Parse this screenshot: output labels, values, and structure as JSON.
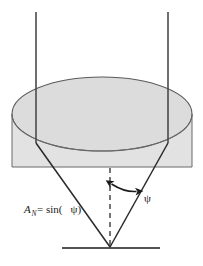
{
  "figure": {
    "background_color": "#ffffff",
    "labels": {
      "formula_a": "A",
      "formula_subscript": "N",
      "formula_equals": " = sin(",
      "formula_close": ")",
      "formula_psi": "ψ",
      "formula_full": "A_N = sin(ψ)",
      "angle_label": "ψ"
    },
    "colors": {
      "cylinder_fill": "#e2e2e2",
      "cylinder_stroke": "#6b6b6b",
      "ellipse_fill": "#dcdcdc",
      "ellipse_stroke": "#5a5a5a",
      "ray_stroke": "#2a2a2a",
      "vertical_ray_stroke": "#4a4a4a",
      "axis_dash_stroke": "#3a3a3a",
      "baseline_stroke": "#1a1a1a",
      "arrow_stroke": "#1a1a1a",
      "text_color": "#1a1a1a"
    },
    "geometry": {
      "rect_left": 12,
      "rect_top": 95,
      "rect_right": 192,
      "rect_bottom": 167,
      "ellipse_cx": 102,
      "ellipse_cy": 114,
      "ellipse_rx": 90,
      "ellipse_ry": 37,
      "vertical_ray_left_x": 36,
      "vertical_ray_right_x": 168,
      "vertical_ray_top_y": 12,
      "apex_x": 110,
      "apex_y": 247,
      "baseline_left_x": 62,
      "baseline_right_x": 160,
      "baseline_y": 248,
      "axis_dash_top_y": 168,
      "angle_degrees": 21
    }
  }
}
